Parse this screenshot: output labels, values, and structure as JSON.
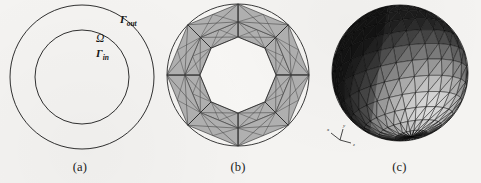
{
  "figure": {
    "background_color": "#f4f3f1",
    "panels": [
      {
        "id": "a",
        "caption": "(a)",
        "type": "annulus-schematic",
        "description": "Two concentric circles forming an annular domain",
        "stroke_color": "#1a1a1a",
        "labels": [
          {
            "name": "outer-boundary",
            "base": "Γ",
            "sub": "out"
          },
          {
            "name": "domain",
            "base": "Ω",
            "sub": ""
          },
          {
            "name": "inner-boundary",
            "base": "Γ",
            "sub": "in"
          }
        ],
        "geometry": {
          "center_x": 82,
          "center_y": 77,
          "outer_radius": 72,
          "inner_radius": 47
        }
      },
      {
        "id": "b",
        "caption": "(b)",
        "type": "annular-triangular-mesh",
        "description": "Triangulated annulus mesh with eight radial sectors and an octagonal inner hole",
        "fill_color": "#b0b0b0",
        "edge_color": "#4a4a4a",
        "sectors": 8,
        "geometry": {
          "center_x": 81,
          "center_y": 75,
          "outer_radius": 71,
          "inner_radius": 38
        }
      },
      {
        "id": "c",
        "caption": "(c)",
        "type": "shaded-triangulated-sphere",
        "description": "Three-dimensional faceted sphere with triangular surface elements and directional shading",
        "dark_color": "#161616",
        "mid_color": "#565656",
        "highlight_color": "#b9b9b9",
        "edge_color": "#0d0d0d",
        "geometry": {
          "center_x": 82,
          "center_y": 73,
          "radius": 68
        },
        "axis_triad": {
          "name": "axis-indicator",
          "x_label": "x",
          "y_label": "y",
          "z_label": "z",
          "position_x": 22,
          "position_y": 140
        }
      }
    ]
  }
}
